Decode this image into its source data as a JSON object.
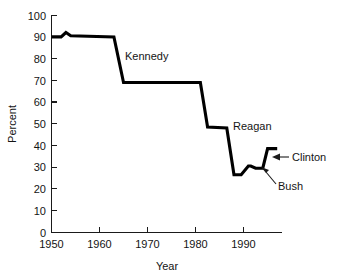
{
  "chart_data": {
    "type": "line",
    "title": "",
    "xlabel": "Year",
    "ylabel": "Percent",
    "xlim": [
      1950,
      1998
    ],
    "ylim": [
      0,
      100
    ],
    "grid": false,
    "legend": "none",
    "x_ticks": [
      "1950",
      "1960",
      "1970",
      "1980",
      "1990"
    ],
    "x_tick_values": [
      1950,
      1960,
      1970,
      1980,
      1990
    ],
    "y_ticks": [
      "0",
      "10",
      "20",
      "30",
      "40",
      "50",
      "60",
      "70",
      "80",
      "90",
      "100"
    ],
    "y_tick_values": [
      0,
      10,
      20,
      30,
      40,
      50,
      60,
      70,
      80,
      90,
      100
    ],
    "series": [
      {
        "name": "Percent",
        "color": "#000000",
        "x": [
          1950,
          1952,
          1953,
          1954,
          1963,
          1965,
          1981,
          1982.5,
          1986.5,
          1988,
          1989.5,
          1991,
          1991.5,
          1992.5,
          1994,
          1995,
          1997
        ],
        "y": [
          90,
          90,
          92,
          90.5,
          90,
          69,
          69,
          48.5,
          48,
          26.5,
          26.5,
          30.5,
          30.5,
          29.5,
          29.5,
          38.5,
          38.5
        ]
      }
    ],
    "annotations": [
      {
        "label": "Kennedy",
        "x_px": 125,
        "y_px": 60,
        "arrow": false
      },
      {
        "label": "Reagan",
        "x_px": 233,
        "y_px": 130,
        "arrow": false
      },
      {
        "label": "Clinton",
        "x_px": 292,
        "y_px": 161,
        "arrow": true,
        "arrow_tip_x": 272,
        "arrow_tip_y": 157,
        "arrow_tail_x": 289,
        "arrow_tail_y": 157
      },
      {
        "label": "Bush",
        "x_px": 278,
        "y_px": 190,
        "arrow": true,
        "arrow_tip_x": 261,
        "arrow_tip_y": 167,
        "arrow_tail_x": 276,
        "arrow_tail_y": 184
      }
    ]
  }
}
